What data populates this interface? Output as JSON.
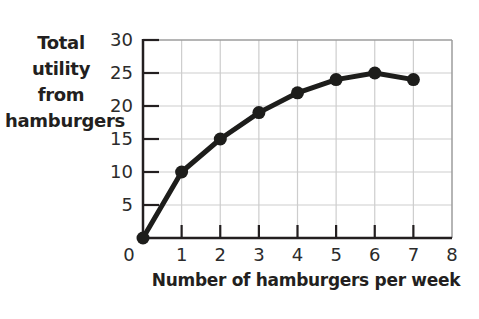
{
  "chart_data": {
    "type": "line",
    "title": "",
    "xlabel": "Number of hamburgers per week",
    "ylabel": "Total utility from hamburgers",
    "x": [
      0,
      1,
      2,
      3,
      4,
      5,
      6,
      7
    ],
    "values": [
      0,
      10,
      15,
      19,
      22,
      24,
      25,
      24
    ],
    "series_name": "Total utility",
    "xlim": [
      0,
      8
    ],
    "ylim": [
      0,
      30
    ],
    "x_ticks": [
      0,
      1,
      2,
      3,
      4,
      5,
      6,
      7,
      8
    ],
    "y_ticks": [
      5,
      10,
      15,
      20,
      25,
      30
    ],
    "grid": true,
    "legend": "none",
    "marker": "filled-circle",
    "colors": {
      "line": "#1d1d1b",
      "marker": "#1d1d1b",
      "axis": "#231f20",
      "gridline": "#cdcdcd",
      "border": "#9c9c9c",
      "text": "#231f20",
      "background": "#ffffff"
    }
  }
}
